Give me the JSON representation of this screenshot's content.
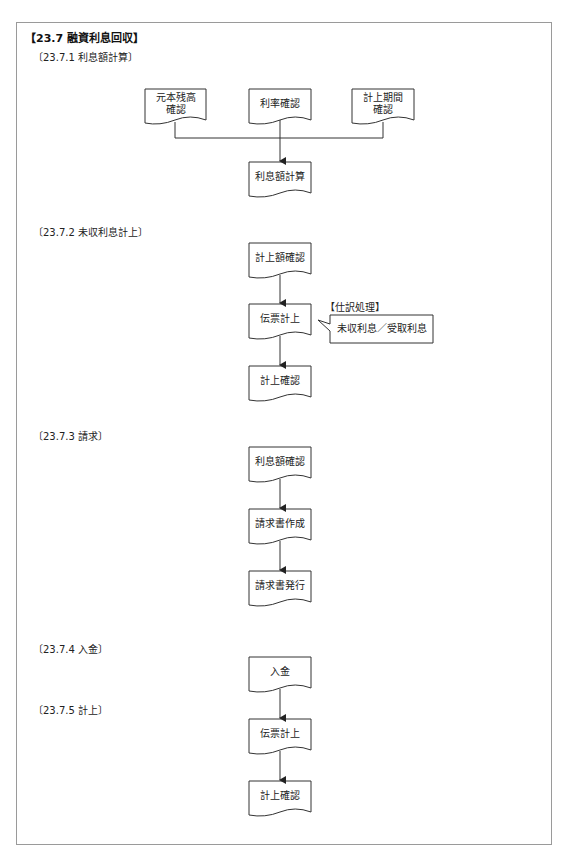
{
  "title": "【23.7 融資利息回収】",
  "sections": [
    {
      "heading": "〔23.7.1 利息額計算〕",
      "inputs": [
        "元本残高\n確認",
        "利率確認",
        "計上期間\n確認"
      ],
      "result": "利息額計算"
    },
    {
      "heading": "〔23.7.2 未収利息計上〕",
      "steps": [
        "計上額確認",
        "伝票計上",
        "計上確認"
      ],
      "note": {
        "title": "【仕訳処理】",
        "text": "未収利息／受取利息"
      }
    },
    {
      "heading": "〔23.7.3 請求〕",
      "steps": [
        "利息額確認",
        "請求書作成",
        "請求書発行"
      ]
    },
    {
      "heading": "〔23.7.4 入金〕",
      "steps": [
        "入金"
      ]
    },
    {
      "heading": "〔23.7.5 計上〕",
      "steps": [
        "伝票計上",
        "計上確認"
      ]
    }
  ],
  "colors": {
    "stroke": "#333333",
    "frame": "#9a9a9a",
    "text": "#222222"
  }
}
